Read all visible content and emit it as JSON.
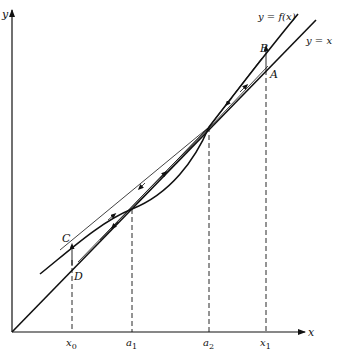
{
  "diagram": {
    "type": "fixed-point iteration cobweb diagram",
    "axes": {
      "x_label": "x",
      "y_label": "y"
    },
    "curves": {
      "f_label": "y = f(x)",
      "identity_label": "y = x"
    },
    "points": {
      "A": "A",
      "B": "B",
      "C": "C",
      "D": "D"
    },
    "ticks": [
      {
        "name": "x",
        "sub": "0"
      },
      {
        "name": "a",
        "sub": "1"
      },
      {
        "name": "a",
        "sub": "2"
      },
      {
        "name": "x",
        "sub": "1"
      }
    ],
    "colors": {
      "ink": "#111111",
      "background": "#ffffff"
    }
  }
}
